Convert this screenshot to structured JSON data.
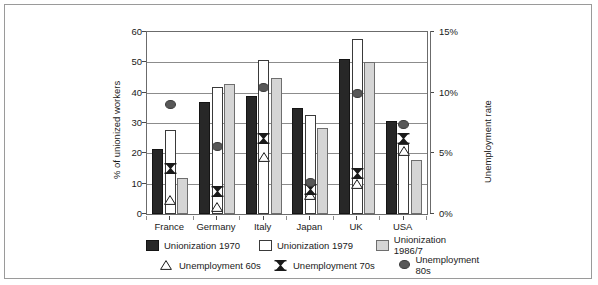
{
  "chart_data": {
    "type": "bar",
    "title": "",
    "xlabel": "",
    "ylabel": "% of unionized workers",
    "y2label": "Unemployment rate",
    "categories": [
      "France",
      "Germany",
      "Italy",
      "Japan",
      "UK",
      "USA"
    ],
    "ylim": [
      0,
      60
    ],
    "y2lim": [
      0,
      15
    ],
    "yticks": [
      "0",
      "10",
      "20",
      "30",
      "40",
      "50",
      "60"
    ],
    "y2ticks": [
      "0%",
      "5%",
      "10%",
      "15%"
    ],
    "grid": true,
    "legend_position": "bottom",
    "series": [
      {
        "name": "Unionization 1970",
        "kind": "bar",
        "axis": "left",
        "color": "#272727",
        "values": [
          21.5,
          37.0,
          39.0,
          34.8,
          51.0,
          30.8
        ]
      },
      {
        "name": "Unionization 1979",
        "kind": "bar",
        "axis": "left",
        "color": "#ffffff",
        "values": [
          27.8,
          41.8,
          50.8,
          32.5,
          57.8,
          23.0
        ]
      },
      {
        "name": "Unionization 1986/7",
        "kind": "bar",
        "axis": "left",
        "color": "#d5d5d5",
        "values": [
          11.8,
          42.7,
          44.8,
          28.3,
          50.0,
          17.7
        ]
      },
      {
        "name": "Unemployment 60s",
        "kind": "marker",
        "marker": "triangle",
        "axis": "right",
        "values": [
          1.5,
          0.9,
          5.0,
          1.9,
          2.8,
          5.5
        ]
      },
      {
        "name": "Unemployment 70s",
        "kind": "marker",
        "marker": "bowtie",
        "axis": "right",
        "values": [
          4.0,
          2.1,
          6.5,
          2.3,
          3.6,
          6.5
        ]
      },
      {
        "name": "Unemployment 80s",
        "kind": "marker",
        "marker": "circle",
        "axis": "right",
        "values": [
          9.0,
          5.6,
          10.4,
          2.6,
          9.9,
          7.4
        ]
      }
    ]
  },
  "axes": {
    "left_title": "% of unionized workers",
    "right_title": "Unemployment rate",
    "left_ticks": [
      "60",
      "50",
      "40",
      "30",
      "20",
      "10",
      "0"
    ],
    "right_ticks": [
      "15%",
      "10%",
      "5%",
      "0%"
    ],
    "x_labels": [
      "France",
      "Germany",
      "Italy",
      "Japan",
      "UK",
      "USA"
    ]
  },
  "legend": {
    "row1": [
      {
        "label": "Unionization 1970",
        "swatch": "solid-dark-square"
      },
      {
        "label": "Unionization 1979",
        "swatch": "white-square"
      },
      {
        "label": "Unionization 1986/7",
        "swatch": "light-gray-square"
      }
    ],
    "row2": [
      {
        "label": "Unemployment 60s",
        "swatch": "open-triangle-marker"
      },
      {
        "label": "Unemployment 70s",
        "swatch": "bowtie-marker"
      },
      {
        "label": "Unemployment 80s",
        "swatch": "filled-circle-marker"
      }
    ]
  }
}
